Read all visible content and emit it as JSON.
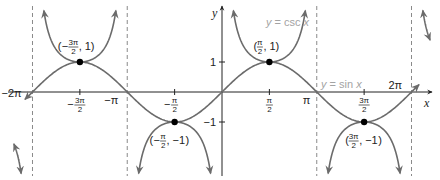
{
  "chart_data": {
    "type": "line",
    "title": "",
    "xlabel": "x",
    "ylabel": "y",
    "xlim": [
      -6.2832,
      6.2832
    ],
    "ylim": [
      -3,
      3
    ],
    "grid": false,
    "series": [
      {
        "name": "y = sin x",
        "function": "sin",
        "color": "#6b6b6b"
      },
      {
        "name": "y = csc x",
        "function": "csc",
        "color": "#6b6b6b"
      }
    ],
    "asymptotes": {
      "labels": [
        "−2π",
        "−π",
        "π",
        "2π"
      ],
      "values": [
        -6.2832,
        -3.1416,
        3.1416,
        6.2832
      ],
      "style": "dashed",
      "color": "#8a8a8a"
    },
    "x_ticks": [
      {
        "value": -4.7124,
        "num": "3π",
        "den": "2",
        "sign": "−"
      },
      {
        "value": -1.5708,
        "num": "π",
        "den": "2",
        "sign": "−"
      },
      {
        "value": 1.5708,
        "num": "π",
        "den": "2",
        "sign": ""
      },
      {
        "value": 4.7124,
        "num": "3π",
        "den": "2",
        "sign": ""
      }
    ],
    "y_ticks": [
      {
        "value": 1,
        "label": "1"
      },
      {
        "value": -1,
        "label": "−1"
      }
    ],
    "points": [
      {
        "x": -4.7124,
        "y": 1,
        "label_sign": "−",
        "label_num": "3π",
        "label_den": "2",
        "label_y": "1"
      },
      {
        "x": -1.5708,
        "y": -1,
        "label_sign": "−",
        "label_num": "π",
        "label_den": "2",
        "label_y": "−1"
      },
      {
        "x": 1.5708,
        "y": 1,
        "label_sign": "",
        "label_num": "π",
        "label_den": "2",
        "label_y": "1"
      },
      {
        "x": 4.7124,
        "y": -1,
        "label_sign": "",
        "label_num": "3π",
        "label_den": "2",
        "label_y": "−1"
      }
    ],
    "annotations": [
      {
        "text_prefix": "y",
        "text_mid": " = csc ",
        "text_var": "x",
        "target": "csc"
      },
      {
        "text_prefix": "y",
        "text_mid": " = sin ",
        "text_var": "x",
        "target": "sin"
      }
    ],
    "legend": "none"
  }
}
